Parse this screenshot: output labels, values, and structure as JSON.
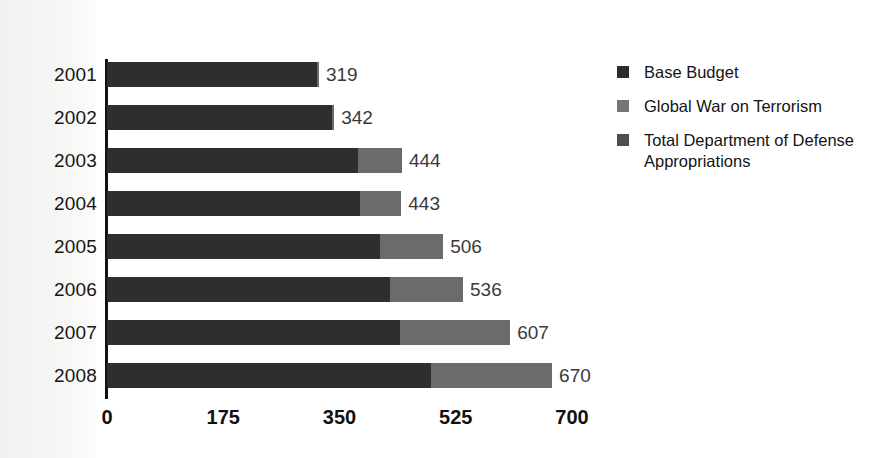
{
  "chart_data": {
    "type": "bar",
    "orientation": "horizontal",
    "stacked": true,
    "title": "",
    "xlabel": "",
    "ylabel": "",
    "categories": [
      "2001",
      "2002",
      "2003",
      "2004",
      "2005",
      "2006",
      "2007",
      "2008"
    ],
    "xticks": [
      "0",
      "175",
      "350",
      "525",
      "700"
    ],
    "xtick_values": [
      0,
      175,
      350,
      525,
      700
    ],
    "xlim": [
      0,
      700
    ],
    "grid": false,
    "legend_position": "right",
    "series": [
      {
        "name": "Base Budget",
        "color": "#2e2e2e",
        "values": [
          316,
          339,
          378,
          381,
          411,
          426,
          441,
          487
        ]
      },
      {
        "name": "Global War on Terrorism",
        "color": "#6b6b6b",
        "values": [
          3,
          3,
          66,
          62,
          95,
          110,
          166,
          183
        ]
      }
    ],
    "totals": [
      319,
      342,
      444,
      443,
      506,
      536,
      607,
      670
    ],
    "data_labels": [
      "319",
      "342",
      "444",
      "443",
      "506",
      "536",
      "607",
      "670"
    ]
  },
  "legend": {
    "items": [
      {
        "label": "Base Budget",
        "color": "#2b2b2b"
      },
      {
        "label": "Global War on Terrorism",
        "color": "#757575"
      },
      {
        "label": "Total Department of Defense Appropriations",
        "color": "#4f4f4f"
      }
    ]
  }
}
